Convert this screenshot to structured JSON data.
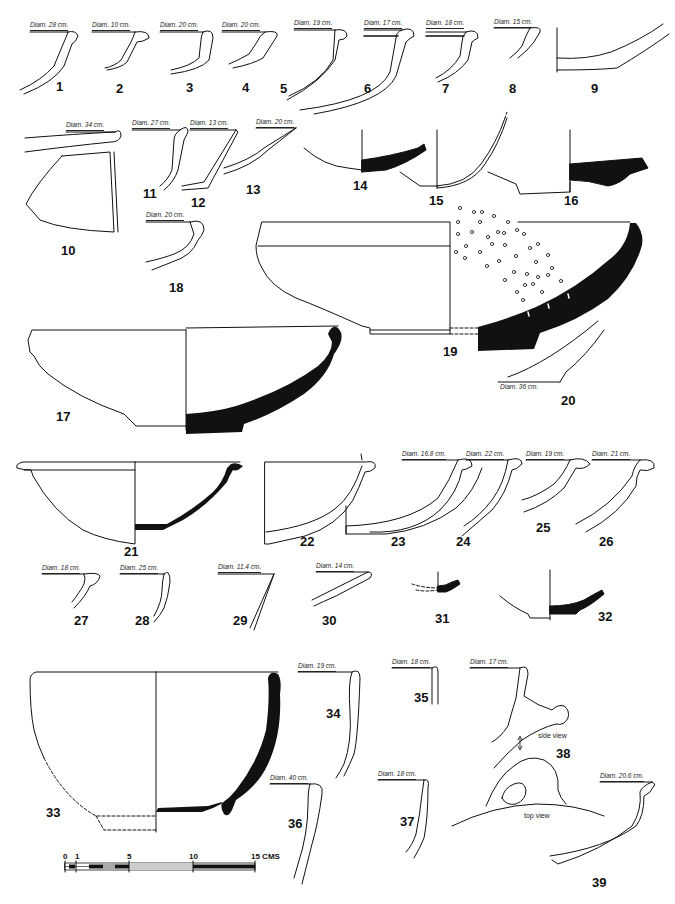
{
  "figure": {
    "background": "#ffffff",
    "ink_color": "#111111",
    "items": [
      {
        "id": "1",
        "label": "1",
        "diam": "Diam. 28 cm."
      },
      {
        "id": "2",
        "label": "2",
        "diam": "Diam. 10 cm."
      },
      {
        "id": "3",
        "label": "3",
        "diam": "Diam. 20 cm."
      },
      {
        "id": "4",
        "label": "4",
        "diam": "Diam. 20 cm."
      },
      {
        "id": "5",
        "label": "5",
        "diam": "Diam. 19 cm."
      },
      {
        "id": "6",
        "label": "6",
        "diam": "Diam. 17 cm."
      },
      {
        "id": "7",
        "label": "7",
        "diam": "Diam. 18 cm."
      },
      {
        "id": "8",
        "label": "8",
        "diam": "Diam. 15 cm."
      },
      {
        "id": "9",
        "label": "9"
      },
      {
        "id": "10",
        "label": "10",
        "diam": "Diam. 34 cm."
      },
      {
        "id": "11",
        "label": "11",
        "diam": "Diam. 27 cm."
      },
      {
        "id": "12",
        "label": "12",
        "diam": "Diam. 13 cm."
      },
      {
        "id": "13",
        "label": "13",
        "diam": "Diam. 20 cm."
      },
      {
        "id": "14",
        "label": "14"
      },
      {
        "id": "15",
        "label": "15"
      },
      {
        "id": "16",
        "label": "16"
      },
      {
        "id": "17",
        "label": "17"
      },
      {
        "id": "18",
        "label": "18",
        "diam": "Diam. 20 cm."
      },
      {
        "id": "19",
        "label": "19"
      },
      {
        "id": "20",
        "label": "20",
        "diam": "Diam. 36 cm."
      },
      {
        "id": "21",
        "label": "21"
      },
      {
        "id": "22",
        "label": "22"
      },
      {
        "id": "23",
        "label": "23",
        "diam": "Diam. 16.8 cm."
      },
      {
        "id": "24",
        "label": "24",
        "diam": "Diam. 22 cm."
      },
      {
        "id": "25",
        "label": "25",
        "diam": "Diam. 19 cm."
      },
      {
        "id": "26",
        "label": "26",
        "diam": "Diam. 21 cm."
      },
      {
        "id": "27",
        "label": "27",
        "diam": "Diam. 18 cm."
      },
      {
        "id": "28",
        "label": "28",
        "diam": "Diam. 25 cm."
      },
      {
        "id": "29",
        "label": "29",
        "diam": "Diam. 11.4 cm."
      },
      {
        "id": "30",
        "label": "30",
        "diam": "Diam. 14 cm."
      },
      {
        "id": "31",
        "label": "31"
      },
      {
        "id": "32",
        "label": "32"
      },
      {
        "id": "33",
        "label": "33"
      },
      {
        "id": "34",
        "label": "34",
        "diam": "Diam. 19 cm."
      },
      {
        "id": "35",
        "label": "35",
        "diam": "Diam. 18 cm."
      },
      {
        "id": "36",
        "label": "36",
        "diam": "Diam. 40 cm."
      },
      {
        "id": "37",
        "label": "37",
        "diam": "Diam. 18 cm."
      },
      {
        "id": "38",
        "label": "38",
        "diam": "Diam. 17 cm.",
        "notes": [
          "side view",
          "top view"
        ]
      },
      {
        "id": "39",
        "label": "39",
        "diam": "Diam. 20.6 cm."
      }
    ],
    "scale_bar": {
      "ticks": [
        "0",
        "1",
        "5",
        "10",
        "15 CMS"
      ],
      "unit": "CMS",
      "max": 15
    }
  }
}
